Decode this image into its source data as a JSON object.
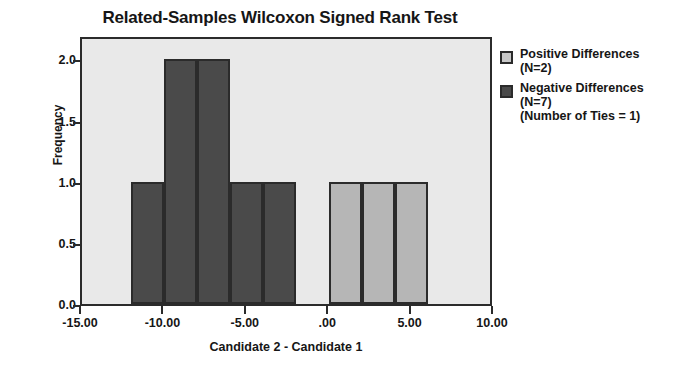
{
  "chart_data": {
    "type": "bar",
    "title": "Related-Samples Wilcoxon Signed Rank Test",
    "xlabel": "Candidate 2 - Candidate 1",
    "ylabel": "Frequency",
    "xlim": [
      -15.0,
      10.0
    ],
    "ylim": [
      0.0,
      2.2
    ],
    "grid": false,
    "legend_position": "right",
    "x_ticks": [
      "-15.00",
      "-10.00",
      "-5.00",
      ".00",
      "5.00",
      "10.00"
    ],
    "x_tick_values": [
      -15,
      -10,
      -5,
      0,
      5,
      10
    ],
    "y_ticks": [
      "0.0",
      "0.5",
      "1.0",
      "1.5",
      "2.0"
    ],
    "y_tick_values": [
      0.0,
      0.5,
      1.0,
      1.5,
      2.0
    ],
    "bin_width": 2.0,
    "series": [
      {
        "name": "Negative Differences",
        "color": "#4a4a4a",
        "n": 7,
        "bins": [
          {
            "x0": -12.0,
            "x1": -10.0,
            "value": 1
          },
          {
            "x0": -10.0,
            "x1": -8.0,
            "value": 2
          },
          {
            "x0": -8.0,
            "x1": -6.0,
            "value": 2
          },
          {
            "x0": -6.0,
            "x1": -4.0,
            "value": 1
          },
          {
            "x0": -4.0,
            "x1": -2.0,
            "value": 1
          }
        ]
      },
      {
        "name": "Positive Differences",
        "color": "#b6b6b6",
        "n": 2,
        "bins": [
          {
            "x0": 0.0,
            "x1": 2.0,
            "value": 1
          },
          {
            "x0": 2.0,
            "x1": 4.0,
            "value": 1
          },
          {
            "x0": 4.0,
            "x1": 6.0,
            "value": 1
          }
        ]
      }
    ],
    "annotations": [
      "(Number of Ties = 1)"
    ]
  },
  "legend": {
    "entries": [
      {
        "label": "Positive Differences",
        "sub": "(N=2)",
        "swatch": "pos"
      },
      {
        "label": "Negative Differences",
        "sub": "(N=7)",
        "swatch": "neg"
      }
    ],
    "note": "(Number of Ties = 1)"
  }
}
